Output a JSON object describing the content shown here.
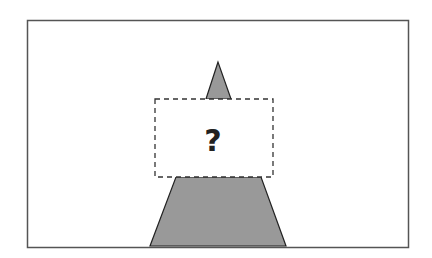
{
  "diagram": {
    "frame": {
      "x": 27,
      "y": 20,
      "width": 381,
      "height": 227,
      "stroke": "#555555"
    },
    "top_triangle": {
      "points": "218,62 206,99 231,99",
      "fill": "#999999",
      "stroke": "#222222"
    },
    "trapezoid": {
      "points": "176,177 261,177 286,246 150,246",
      "fill": "#999999",
      "stroke": "#222222"
    },
    "hidden_box": {
      "x": 155,
      "y": 99,
      "width": 118,
      "height": 78,
      "stroke": "#333333"
    },
    "question_label": "?",
    "question_color": "#222222"
  }
}
